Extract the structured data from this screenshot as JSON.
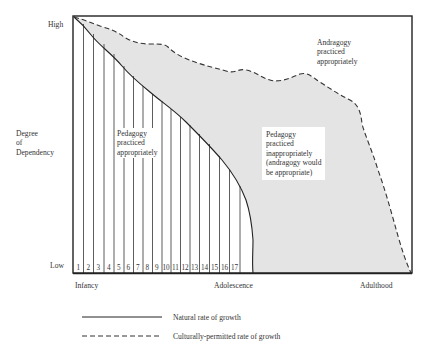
{
  "diagram": {
    "y_axis": {
      "title_lines": [
        "Degree",
        "of",
        "Dependency"
      ],
      "high_label": "High",
      "low_label": "Low"
    },
    "x_axis": {
      "labels": [
        "Infancy",
        "Adolescence",
        "Adulthood"
      ]
    },
    "age_boxes": [
      "1",
      "2",
      "3",
      "4",
      "5",
      "6",
      "7",
      "8",
      "9",
      "10",
      "11",
      "12",
      "13",
      "14",
      "15",
      "16",
      "17"
    ],
    "regions": {
      "pedagogy_appropriate": [
        "Pedagogy",
        "practiced",
        "appropriately"
      ],
      "pedagogy_inappropriate": [
        "Pedagogy",
        "practiced",
        "inappropriately",
        "(andragogy would",
        "be appropriate)"
      ],
      "andragogy_appropriate": [
        "Andragogy",
        "practiced",
        "appropriately"
      ]
    },
    "legend": [
      {
        "style": "solid",
        "label": "Natural rate of growth"
      },
      {
        "style": "dashed",
        "label": "Culturally-permitted rate of growth"
      }
    ],
    "colors": {
      "frame": "#222222",
      "shade": "#e4e4e4",
      "background": "#ffffff"
    }
  }
}
